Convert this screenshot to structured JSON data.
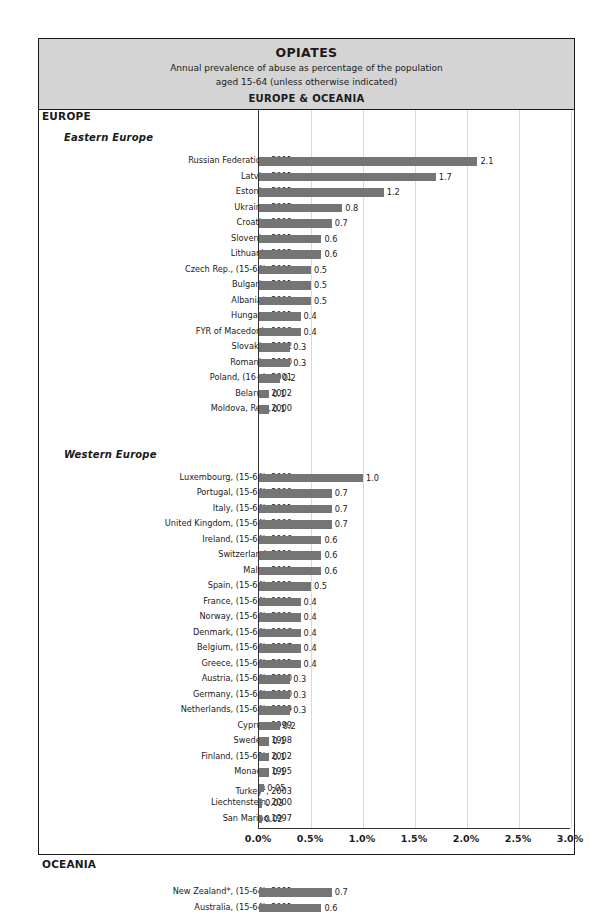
{
  "header": {
    "title": "OPIATES",
    "subtitle_line1": "Annual prevalence of abuse as percentage of the population",
    "subtitle_line2": "aged 15-64 (unless otherwise indicated)",
    "region": "EUROPE & OCEANIA"
  },
  "sections": {
    "europe": "EUROPE",
    "eastern_europe": "Eastern Europe",
    "western_europe": "Western Europe",
    "oceania": "OCEANIA"
  },
  "colors": {
    "bar": "#757575",
    "header_band": "#d4d4d4",
    "grid": "#d9d9d9",
    "axis": "#333333",
    "frame": "#1a1a1a"
  },
  "chart_data": {
    "type": "bar",
    "orientation": "horizontal",
    "title": "OPIATES",
    "subtitle": "Annual prevalence of abuse as percentage of the population aged 15-64 (unless otherwise indicated)",
    "region": "EUROPE & OCEANIA",
    "xlabel": "",
    "ylabel": "",
    "xlim": [
      0,
      3.0
    ],
    "xticks": [
      "0.0%",
      "0.5%",
      "1.0%",
      "1.5%",
      "2.0%",
      "2.5%",
      "3.0%"
    ],
    "xtick_values": [
      0.0,
      0.5,
      1.0,
      1.5,
      2.0,
      2.5,
      3.0
    ],
    "grid": true,
    "legend": "none",
    "groups": [
      {
        "group": "EUROPE",
        "subgroup": "Eastern Europe",
        "categories": [
          "Russian Federation,  2001",
          "Latvia, 2001",
          "Estonia, 2001",
          "Ukraine, 2002",
          "Croatia,  1999",
          "Slovenia, 2001",
          "Lithuania,2002",
          "Czech Rep., (15-64), 2001",
          "Bulgaria, 2001",
          "Albania*, 2000",
          "Hungary, 2001",
          "FYR of Macedonia,1998",
          "Slovakia, 2002",
          "Romania, 2000",
          "Poland, (16+), 2001",
          "Belarus, 2002",
          "Moldova, Rep.,2000"
        ],
        "values": [
          2.1,
          1.7,
          1.2,
          0.8,
          0.7,
          0.6,
          0.6,
          0.5,
          0.5,
          0.5,
          0.4,
          0.4,
          0.3,
          0.3,
          0.2,
          0.1,
          0.1
        ],
        "labels": [
          "2.1",
          "1.7",
          "1.2",
          "0.8",
          "0.7",
          "0.6",
          "0.6",
          "0.5",
          "0.5",
          "0.5",
          "0.4",
          "0.4",
          "0.3",
          "0.3",
          "0.2",
          "0.1",
          "0.1"
        ]
      },
      {
        "group": "EUROPE",
        "subgroup": "Western Europe",
        "categories": [
          "Luxembourg, (15-64), 2000",
          "Portugal, (15-64), 2000",
          "Italy,  (15-64), 2001",
          "United Kingdom, (15-64), 2000",
          "Ireland, (15-64), 1996",
          "Switzerland, 2000",
          "Malta, 2001",
          "Spain, (15-64), 1999",
          "France, (15-64), 1999",
          "Norway, (15-64), 2000",
          "Denmark, (15-64), 1996",
          "Belgium, (15-64), 1997",
          "Greece, (15-64), 2001",
          "Austria, (15-64), 2000",
          "Germany, (15-64), 2000",
          "Netherlands, (15-64), 1999",
          "Cyprus, 1999",
          "Sweden, 1998",
          "Finland, (15-69), 2002",
          "Monaco,  1995",
          "Turkey, 2003",
          "Liechtenstein, 2000",
          "San Marino,1997"
        ],
        "values": [
          1.0,
          0.7,
          0.7,
          0.7,
          0.6,
          0.6,
          0.6,
          0.5,
          0.4,
          0.4,
          0.4,
          0.4,
          0.4,
          0.3,
          0.3,
          0.3,
          0.2,
          0.1,
          0.1,
          0.1,
          0.05,
          0.03,
          0.02
        ],
        "labels": [
          "1.0",
          "0.7",
          "0.7",
          "0.7",
          "0.6",
          "0.6",
          "0.6",
          "0.5",
          "0.4",
          "0.4",
          "0.4",
          "0.4",
          "0.4",
          "0.3",
          "0.3",
          "0.3",
          "0.2",
          "0.1",
          "0.1",
          "0.1",
          "0.05",
          "0.03",
          "0.02"
        ],
        "footnotes": {
          "Turkey, 2003": "1"
        }
      },
      {
        "group": "OCEANIA",
        "subgroup": "",
        "categories": [
          "New Zealand*, (15-64), 2001",
          "Australia, (15-64), 2001"
        ],
        "values": [
          0.7,
          0.6
        ],
        "labels": [
          "0.7",
          "0.6"
        ]
      }
    ]
  }
}
